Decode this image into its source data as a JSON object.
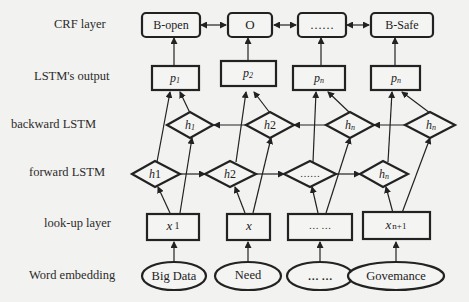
{
  "layers": {
    "crf": "CRF layer",
    "lstm_output": "LSTM's output",
    "backward": "backward LSTM",
    "forward": "forward LSTM",
    "lookup": "look-up layer",
    "embedding": "Word embedding"
  },
  "crf_nodes": [
    "B-open",
    "O",
    "……",
    "B-Safe"
  ],
  "output_nodes": [
    {
      "base": "p",
      "sub": "1"
    },
    {
      "base": "p",
      "sub": "2"
    },
    {
      "base": "p",
      "sub": "n"
    },
    {
      "base": "p",
      "sub": "n"
    }
  ],
  "backward_nodes": [
    {
      "base": "h",
      "sub": "1"
    },
    {
      "base": "h",
      "sub": "2"
    },
    {
      "base": "h",
      "sub": "n"
    },
    {
      "base": "h",
      "sub": "n"
    }
  ],
  "forward_nodes": [
    {
      "base": "h",
      "sub": "1"
    },
    {
      "base": "h",
      "sub": "2"
    },
    {
      "base": "",
      "sub": "",
      "text": "……"
    },
    {
      "base": "h",
      "sub": "n"
    }
  ],
  "lookup_nodes": [
    {
      "base": "x",
      "sub": "1"
    },
    {
      "base": "x",
      "sub": ""
    },
    {
      "base": "",
      "sub": "",
      "text": "… …"
    },
    {
      "base": "x",
      "sub": "n+1"
    }
  ],
  "embedding_nodes": [
    "Big Data",
    "Need",
    "… …",
    "Govemance"
  ],
  "colors": {
    "background": "#f2f2f0",
    "stroke": "#222222"
  }
}
